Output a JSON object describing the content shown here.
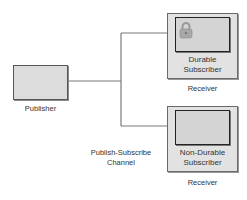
{
  "diagram": {
    "publisher": {
      "label": "Publisher"
    },
    "channel": {
      "label_line1": "Publish-Subscribe",
      "label_line2": "Channel"
    },
    "receivers": [
      {
        "subscriber_line1": "Durable",
        "subscriber_line2": "Subscriber",
        "receiver_label": "Receiver",
        "icon": "lock-icon"
      },
      {
        "subscriber_line1": "Non-Durable",
        "subscriber_line2": "Subscriber",
        "receiver_label": "Receiver",
        "icon": null
      }
    ],
    "colors": {
      "line": "#7a7a7a",
      "box_fill": "#dcdcdc",
      "outer_fill": "#e2e2e2",
      "lock": "#a8a8a8"
    }
  }
}
